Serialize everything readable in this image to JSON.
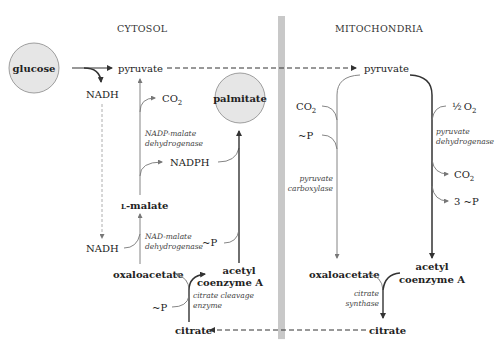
{
  "compartments": {
    "left": "CYTOSOL",
    "right": "MITOCHONDRIA"
  },
  "colors": {
    "divider": "#c8c8c8",
    "circle_fill": "#e6e6e6",
    "circle_stroke": "#888888",
    "line": "#333333",
    "thin_line": "#777777"
  },
  "cytosol": {
    "glucose": "glucose",
    "pyruvate": "pyruvate",
    "nadh_top": "NADH",
    "co2": "CO",
    "co2_sub": "2",
    "palmitate": "palmitate",
    "nadp_enzyme_line1": "NADP-malate",
    "nadp_enzyme_line2": "dehydrogenase",
    "nadph": "NADPH",
    "malate_prefix": "L",
    "malate": "-malate",
    "nadh_bottom": "NADH",
    "nad_enzyme_line1": "NAD-malate",
    "nad_enzyme_line2": "dehydrogenase",
    "phosphate_1": "~P",
    "oxaloacetate": "oxaloacetate",
    "acetyl_line1": "acetyl",
    "acetyl_line2": "coenzyme A",
    "phosphate_2": "~P",
    "cleavage_line1": "citrate cleavage",
    "cleavage_line2": "enzyme",
    "citrate": "citrate"
  },
  "mitochondria": {
    "pyruvate": "pyruvate",
    "co2_left": "CO",
    "co2_left_sub": "2",
    "phosphate": "~P",
    "carboxylase_line1": "pyruvate",
    "carboxylase_line2": "carboxylase",
    "half_o2": "O",
    "half_o2_sub": "2",
    "half": "½",
    "dehydrogenase_line1": "pyruvate",
    "dehydrogenase_line2": "dehydrogenase",
    "co2_right": "CO",
    "co2_right_sub": "2",
    "three_p": "3 ~P",
    "oxaloacetate": "oxaloacetate",
    "acetyl_line1": "acetyl",
    "acetyl_line2": "coenzyme A",
    "synthase_line1": "citrate",
    "synthase_line2": "synthase",
    "citrate": "citrate"
  }
}
